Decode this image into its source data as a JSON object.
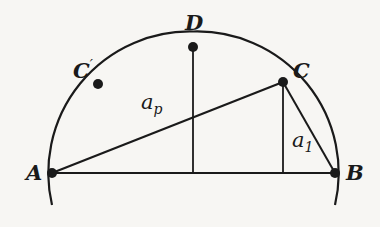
{
  "diagram": {
    "type": "semicircle-geometry",
    "stroke_color": "#1a1a1a",
    "background": "#f7f6f3",
    "points": {
      "A": {
        "label": "A",
        "x": 52,
        "y": 173
      },
      "B": {
        "label": "B",
        "x": 335,
        "y": 173
      },
      "C": {
        "label": "C",
        "x": 283,
        "y": 82
      },
      "C_prime": {
        "label": "C",
        "prime": "′",
        "x": 98,
        "y": 82
      },
      "D": {
        "label": "D",
        "x": 193,
        "y": 47
      }
    },
    "segments": {
      "a_p": {
        "base": "a",
        "sub": "p"
      },
      "a_1": {
        "base": "a",
        "sub": "1"
      }
    }
  }
}
